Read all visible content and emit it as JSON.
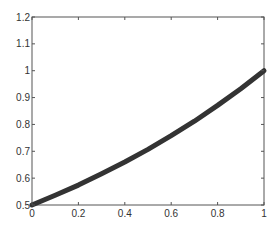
{
  "chart_data": {
    "type": "line",
    "title": "",
    "xlabel": "",
    "ylabel": "",
    "xlim": [
      0,
      1
    ],
    "ylim": [
      0.5,
      1.2
    ],
    "grid": false,
    "legend": null,
    "x_ticks": [
      "0",
      "0.2",
      "0.4",
      "0.6",
      "0.8",
      "1"
    ],
    "y_ticks": [
      "0.5",
      "0.6",
      "0.7",
      "0.8",
      "0.9",
      "1",
      "1.1",
      "1.2"
    ],
    "series": [
      {
        "name": "curve",
        "color": "#333333",
        "line_width": 5,
        "x": [
          0,
          0.1,
          0.2,
          0.3,
          0.4,
          0.5,
          0.6,
          0.7,
          0.8,
          0.9,
          1.0
        ],
        "y": [
          0.5,
          0.536,
          0.574,
          0.616,
          0.66,
          0.707,
          0.758,
          0.812,
          0.871,
          0.933,
          1.0
        ]
      }
    ]
  },
  "style": {
    "axis_color": "#555555",
    "text_color": "#333333",
    "background": "#ffffff"
  }
}
